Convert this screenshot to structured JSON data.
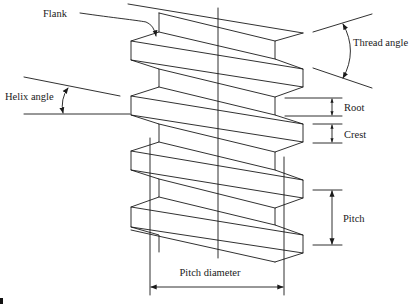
{
  "diagram": {
    "type": "screw-thread-terminology",
    "labels": {
      "flank": "Flank",
      "thread_angle": "Thread angle",
      "helix_angle": "Helix angle",
      "root": "Root",
      "crest": "Crest",
      "pitch": "Pitch",
      "pitch_diameter": "Pitch diameter"
    },
    "colors": {
      "line": "#1a1a1a",
      "background": "#ffffff"
    }
  }
}
